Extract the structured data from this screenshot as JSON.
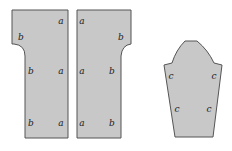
{
  "diagram": {
    "colors": {
      "fill": "#c8c8c8",
      "stroke": "#555555",
      "background": "#ffffff"
    },
    "pieces": [
      {
        "name": "left-front-piece",
        "labels": [
          {
            "text": "a",
            "x": 61,
            "y": 24
          },
          {
            "text": "b",
            "x": 21,
            "y": 40
          },
          {
            "text": "b",
            "x": 31,
            "y": 74
          },
          {
            "text": "a",
            "x": 61,
            "y": 74
          },
          {
            "text": "b",
            "x": 31,
            "y": 126
          },
          {
            "text": "a",
            "x": 61,
            "y": 126
          }
        ]
      },
      {
        "name": "right-front-piece",
        "labels": [
          {
            "text": "a",
            "x": 82,
            "y": 24
          },
          {
            "text": "b",
            "x": 121,
            "y": 40
          },
          {
            "text": "a",
            "x": 82,
            "y": 74
          },
          {
            "text": "b",
            "x": 112,
            "y": 74
          },
          {
            "text": "a",
            "x": 82,
            "y": 126
          },
          {
            "text": "b",
            "x": 112,
            "y": 126
          }
        ]
      },
      {
        "name": "sleeve-piece",
        "labels": [
          {
            "text": "c",
            "x": 171,
            "y": 79
          },
          {
            "text": "c",
            "x": 214,
            "y": 79
          },
          {
            "text": "c",
            "x": 177,
            "y": 112
          },
          {
            "text": "c",
            "x": 209,
            "y": 112
          }
        ]
      }
    ]
  }
}
